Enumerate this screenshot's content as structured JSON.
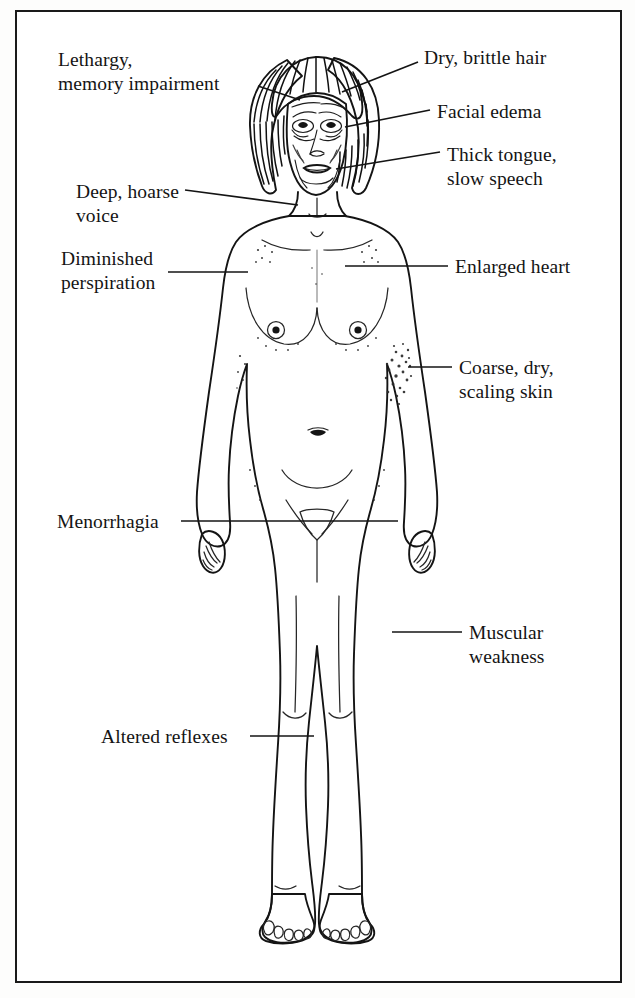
{
  "figure": {
    "view": "anterior full-body nude female illustration",
    "style": "pen-and-ink stipple line drawing",
    "border_color": "#1a1a1a",
    "ink_color": "#141414",
    "background_color": "#ffffff"
  },
  "labels": [
    {
      "id": "lethargy",
      "text": "Lethargy,\nmemory impairment",
      "side": "left",
      "target": "head/brain"
    },
    {
      "id": "hair",
      "text": "Dry, brittle hair",
      "side": "right",
      "target": "scalp hair"
    },
    {
      "id": "facial-edema",
      "text": "Facial edema",
      "side": "right",
      "target": "face"
    },
    {
      "id": "tongue",
      "text": "Thick tongue,\nslow speech",
      "side": "right",
      "target": "mouth"
    },
    {
      "id": "voice",
      "text": "Deep, hoarse\nvoice",
      "side": "left",
      "target": "throat/larynx"
    },
    {
      "id": "perspiration",
      "text": "Diminished\nperspiration",
      "side": "left",
      "target": "chest/axilla"
    },
    {
      "id": "heart",
      "text": "Enlarged heart",
      "side": "right",
      "target": "chest"
    },
    {
      "id": "skin",
      "text": "Coarse, dry,\nscaling skin",
      "side": "right",
      "target": "flank skin"
    },
    {
      "id": "menorrhagia",
      "text": "Menorrhagia",
      "side": "left",
      "target": "pelvis"
    },
    {
      "id": "muscular",
      "text": "Muscular\nweakness",
      "side": "right",
      "target": "thigh"
    },
    {
      "id": "reflexes",
      "text": "Altered reflexes",
      "side": "left",
      "target": "knee"
    }
  ]
}
